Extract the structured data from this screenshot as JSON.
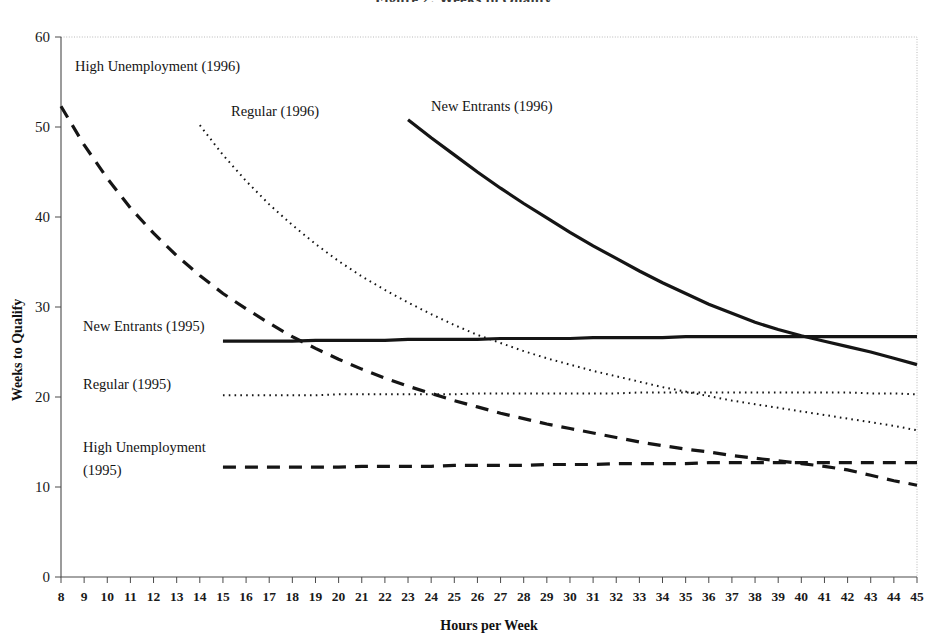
{
  "chart_data": {
    "type": "line",
    "title": "Figure 2: Weeks to Qualify",
    "xlabel": "Hours per Week",
    "ylabel": "Weeks to Qualify",
    "xlim": [
      8,
      45
    ],
    "ylim": [
      0,
      60
    ],
    "yticks": [
      0,
      10,
      20,
      30,
      40,
      50,
      60
    ],
    "xticks": [
      8,
      9,
      10,
      11,
      12,
      13,
      14,
      15,
      16,
      17,
      18,
      19,
      20,
      21,
      22,
      23,
      24,
      25,
      26,
      27,
      28,
      29,
      30,
      31,
      32,
      33,
      34,
      35,
      36,
      37,
      38,
      39,
      40,
      41,
      42,
      43,
      44,
      45
    ],
    "grid": false,
    "legend_position": "inline-annotations",
    "series": [
      {
        "name": "High Unemployment (1996)",
        "style": "dashed-long",
        "x": [
          8,
          9,
          10,
          11,
          12,
          13,
          14,
          15,
          16,
          17,
          18,
          19,
          20,
          21,
          22,
          23,
          24,
          25,
          26,
          27,
          28,
          29,
          30,
          31,
          32,
          33,
          34,
          35,
          36,
          37,
          38,
          39,
          40,
          41,
          42,
          43,
          44,
          45
        ],
        "y": [
          52.3,
          48.0,
          44.3,
          41.0,
          38.2,
          35.7,
          33.5,
          31.5,
          29.8,
          28.2,
          26.7,
          25.4,
          24.2,
          23.1,
          22.1,
          21.2,
          20.4,
          19.6,
          18.9,
          18.2,
          17.6,
          17.0,
          16.5,
          16.0,
          15.5,
          15.0,
          14.6,
          14.2,
          13.9,
          13.5,
          13.2,
          12.9,
          12.6,
          12.3,
          11.9,
          11.3,
          10.7,
          10.2
        ]
      },
      {
        "name": "Regular (1996)",
        "style": "dotted",
        "x": [
          14,
          15,
          16,
          17,
          18,
          19,
          20,
          21,
          22,
          23,
          24,
          25,
          26,
          27,
          28,
          29,
          30,
          31,
          32,
          33,
          34,
          35,
          36,
          37,
          38,
          39,
          40,
          41,
          42,
          43,
          44,
          45
        ],
        "y": [
          50.2,
          46.9,
          44.0,
          41.4,
          39.1,
          37.0,
          35.1,
          33.4,
          31.9,
          30.5,
          29.2,
          28.0,
          26.9,
          26.0,
          25.1,
          24.3,
          23.6,
          22.9,
          22.3,
          21.7,
          21.1,
          20.6,
          20.1,
          19.6,
          19.2,
          18.8,
          18.4,
          18.0,
          17.6,
          17.2,
          16.8,
          16.3
        ]
      },
      {
        "name": "New Entrants (1996)",
        "style": "solid-thick",
        "x": [
          23,
          24,
          25,
          26,
          27,
          28,
          29,
          30,
          31,
          32,
          33,
          34,
          35,
          36,
          37,
          38,
          39,
          40,
          41,
          42,
          43,
          44,
          45
        ],
        "y": [
          50.8,
          48.8,
          46.9,
          45.0,
          43.2,
          41.5,
          39.9,
          38.3,
          36.8,
          35.4,
          34.0,
          32.7,
          31.5,
          30.3,
          29.3,
          28.3,
          27.5,
          26.8,
          26.2,
          25.6,
          25.0,
          24.3,
          23.6
        ]
      },
      {
        "name": "New Entrants (1995)",
        "style": "solid-thick",
        "x": [
          15,
          16,
          17,
          18,
          19,
          20,
          21,
          22,
          23,
          24,
          25,
          26,
          27,
          28,
          29,
          30,
          31,
          32,
          33,
          34,
          35,
          36,
          37,
          38,
          39,
          40,
          41,
          42,
          43,
          44,
          45
        ],
        "y": [
          26.2,
          26.2,
          26.2,
          26.2,
          26.3,
          26.3,
          26.3,
          26.3,
          26.4,
          26.4,
          26.4,
          26.4,
          26.5,
          26.5,
          26.5,
          26.5,
          26.6,
          26.6,
          26.6,
          26.6,
          26.7,
          26.7,
          26.7,
          26.7,
          26.7,
          26.7,
          26.7,
          26.7,
          26.7,
          26.7,
          26.7
        ]
      },
      {
        "name": "Regular (1995)",
        "style": "dotted",
        "x": [
          15,
          16,
          17,
          18,
          19,
          20,
          21,
          22,
          23,
          24,
          25,
          26,
          27,
          28,
          29,
          30,
          31,
          32,
          33,
          34,
          35,
          36,
          37,
          38,
          39,
          40,
          41,
          42,
          43,
          44,
          45
        ],
        "y": [
          20.2,
          20.2,
          20.2,
          20.2,
          20.2,
          20.3,
          20.3,
          20.3,
          20.3,
          20.3,
          20.3,
          20.4,
          20.4,
          20.4,
          20.4,
          20.4,
          20.4,
          20.4,
          20.5,
          20.5,
          20.5,
          20.5,
          20.5,
          20.5,
          20.5,
          20.5,
          20.5,
          20.5,
          20.4,
          20.4,
          20.3
        ]
      },
      {
        "name": "High Unemployment (1995)",
        "style": "dashed-long",
        "x": [
          15,
          16,
          17,
          18,
          19,
          20,
          21,
          22,
          23,
          24,
          25,
          26,
          27,
          28,
          29,
          30,
          31,
          32,
          33,
          34,
          35,
          36,
          37,
          38,
          39,
          40,
          41,
          42,
          43,
          44,
          45
        ],
        "y": [
          12.2,
          12.2,
          12.2,
          12.2,
          12.2,
          12.2,
          12.3,
          12.3,
          12.3,
          12.3,
          12.4,
          12.4,
          12.4,
          12.4,
          12.5,
          12.5,
          12.5,
          12.6,
          12.6,
          12.6,
          12.6,
          12.7,
          12.7,
          12.7,
          12.7,
          12.7,
          12.7,
          12.7,
          12.7,
          12.7,
          12.7
        ]
      }
    ],
    "annotations": [
      {
        "id": "ann-high-unemp-1996",
        "text": "High Unemployment (1996)",
        "x_px": 75,
        "y_px": 71
      },
      {
        "id": "ann-regular-1996",
        "text": "Regular (1996)",
        "x_px": 231,
        "y_px": 116
      },
      {
        "id": "ann-new-entrants-1996",
        "text": "New Entrants (1996)",
        "x_px": 431,
        "y_px": 111
      },
      {
        "id": "ann-new-entrants-1995",
        "text": "New Entrants (1995)",
        "x_px": 83,
        "y_px": 331
      },
      {
        "id": "ann-regular-1995",
        "text": "Regular (1995)",
        "x_px": 83,
        "y_px": 389
      },
      {
        "id": "ann-high-unemp-1995-line1",
        "text": "High Unemployment",
        "x_px": 83,
        "y_px": 452
      },
      {
        "id": "ann-high-unemp-1995-line2",
        "text": "(1995)",
        "x_px": 83,
        "y_px": 475
      }
    ]
  },
  "axis": {
    "y_title": "Weeks to Qualify",
    "x_title": "Hours per Week"
  }
}
